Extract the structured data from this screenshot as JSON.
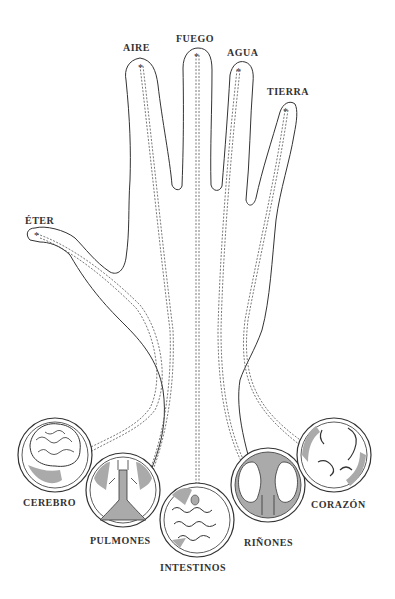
{
  "diagram": {
    "fingers": [
      {
        "element": "ÉTER",
        "finger": "thumb"
      },
      {
        "element": "AIRE",
        "finger": "index"
      },
      {
        "element": "FUEGO",
        "finger": "middle"
      },
      {
        "element": "AGUA",
        "finger": "ring"
      },
      {
        "element": "TIERRA",
        "finger": "little"
      }
    ],
    "organs": [
      {
        "name": "CEREBRO"
      },
      {
        "name": "PULMONES"
      },
      {
        "name": "INTESTINOS"
      },
      {
        "name": "RIÑONES"
      },
      {
        "name": "CORAZÓN"
      }
    ],
    "colors": {
      "line": "#333333",
      "shade": "#9a9a9a",
      "background": "#ffffff"
    }
  }
}
